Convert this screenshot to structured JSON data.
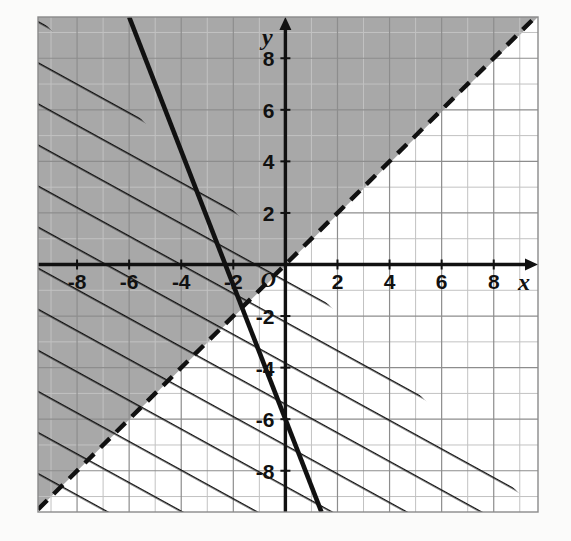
{
  "figure": {
    "background_color": "#fbfbfa",
    "plot_background_color": "#ffffff",
    "border_color": "#8a8a8a"
  },
  "axes": {
    "x_axis_label": "x",
    "y_axis_label": "y",
    "origin_label": "O",
    "axis_color": "#111111",
    "x_tick_labels": [
      "-8",
      "-6",
      "-4",
      "-2",
      "2",
      "4",
      "6",
      "8"
    ],
    "x_tick_values": [
      -8,
      -6,
      -4,
      -2,
      2,
      4,
      6,
      8
    ],
    "y_tick_labels": [
      "8",
      "6",
      "4",
      "2",
      "-2",
      "-4",
      "-6",
      "-8"
    ],
    "y_tick_values": [
      8,
      6,
      4,
      2,
      -2,
      -4,
      -6,
      -8
    ]
  },
  "chart_data": {
    "type": "line",
    "xlabel": "x",
    "ylabel": "y",
    "xlim": [
      -9.5,
      9.7
    ],
    "ylim": [
      -9.6,
      9.6
    ],
    "grid": true,
    "grid_step": 1,
    "major_grid_step": 2,
    "grid_color": "#b9b9b9",
    "major_grid_color": "#8d8d8d",
    "legend": "none",
    "series": [
      {
        "name": "solid-boundary-line",
        "style": "solid",
        "color": "#111111",
        "width": 4,
        "slope": -2.6,
        "intercept": -6,
        "equation": "y = -2.6x - 6",
        "x_intercept": -2.31,
        "y_intercept": -6,
        "points": [
          [
            -7.3,
            12.98
          ],
          [
            0,
            -6
          ],
          [
            1.38,
            -9.6
          ]
        ],
        "shaded_side": "above-right",
        "shading_style": "hatch",
        "boundary_included": true
      },
      {
        "name": "dashed-boundary-line",
        "style": "dashed",
        "color": "#111111",
        "width": 4,
        "slope": 1,
        "intercept": 0,
        "equation": "y = x",
        "x_intercept": 0,
        "y_intercept": 0,
        "points": [
          [
            -9.5,
            -9.5
          ],
          [
            0,
            0
          ],
          [
            9.6,
            9.6
          ]
        ],
        "shaded_side": "above-left",
        "shading_style": "gray-fill",
        "boundary_included": false
      }
    ],
    "regions": [
      {
        "name": "gray-shaded-region",
        "description": "y > x",
        "fill_color": "#a8a8a8",
        "fill_opacity": 1
      },
      {
        "name": "hatched-region",
        "description": "y >= -2.6x - 6",
        "hatch_color": "#111111",
        "hatch_slope": -0.55,
        "hatch_spacing_px": 36
      }
    ]
  }
}
